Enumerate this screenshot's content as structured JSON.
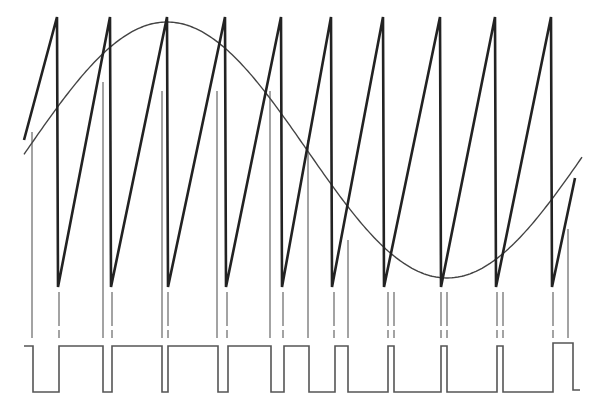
{
  "figure": {
    "colors": {
      "background": "#ffffff",
      "sawtooth": "#222222",
      "sine": "#444444",
      "markers": "#666666",
      "pwm": "#555555"
    },
    "sawtooth": {
      "start": [
        24,
        140
      ],
      "peaks_x": [
        57,
        110,
        167,
        225,
        281,
        331,
        383,
        440,
        495,
        551
      ],
      "peak_y": 17,
      "bottom_y": 287,
      "end": [
        575,
        178
      ]
    },
    "sine": {
      "x_start": 24,
      "x_end": 583,
      "center_y": 150,
      "amplitude": 128,
      "max_x": 167,
      "period_px": 560
    },
    "crossing_marks": {
      "tall_x": [
        32,
        103,
        162,
        217,
        270,
        308,
        348,
        568
      ],
      "tall_top_y": [
        132,
        82,
        91,
        91,
        91,
        140,
        240,
        229
      ],
      "short_x": [
        59,
        112,
        168,
        227,
        283,
        334,
        388,
        394,
        441,
        447,
        497,
        503,
        553
      ],
      "bottom_y": 338
    },
    "pwm": {
      "high_y": 346,
      "low_y": 392,
      "points": [
        [
          24,
          346
        ],
        [
          33,
          346
        ],
        [
          33,
          392
        ],
        [
          59,
          392
        ],
        [
          59,
          346
        ],
        [
          103,
          346
        ],
        [
          103,
          392
        ],
        [
          112,
          392
        ],
        [
          112,
          346
        ],
        [
          162,
          346
        ],
        [
          162,
          392
        ],
        [
          168,
          392
        ],
        [
          168,
          346
        ],
        [
          218,
          346
        ],
        [
          218,
          392
        ],
        [
          228,
          392
        ],
        [
          228,
          346
        ],
        [
          271,
          346
        ],
        [
          271,
          392
        ],
        [
          284,
          392
        ],
        [
          284,
          346
        ],
        [
          309,
          346
        ],
        [
          309,
          392
        ],
        [
          335,
          392
        ],
        [
          335,
          346
        ],
        [
          348,
          346
        ],
        [
          348,
          392
        ],
        [
          388,
          392
        ],
        [
          388,
          346
        ],
        [
          394,
          346
        ],
        [
          394,
          392
        ],
        [
          441,
          392
        ],
        [
          441,
          346
        ],
        [
          447,
          346
        ],
        [
          447,
          392
        ],
        [
          497,
          392
        ],
        [
          497,
          346
        ],
        [
          503,
          346
        ],
        [
          503,
          392
        ],
        [
          553,
          392
        ],
        [
          553,
          343
        ],
        [
          573,
          343
        ],
        [
          573,
          390
        ],
        [
          580,
          390
        ]
      ]
    }
  }
}
